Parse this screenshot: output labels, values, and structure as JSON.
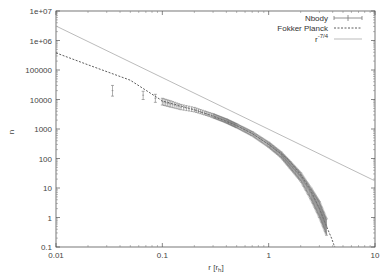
{
  "chart_data": {
    "type": "line",
    "title": "",
    "xlabel": "r [r_h]",
    "ylabel": "n",
    "xscale": "log",
    "yscale": "log",
    "xlim": [
      0.01,
      10
    ],
    "ylim": [
      0.1,
      10000000
    ],
    "grid": false,
    "legend_position": "top-right",
    "x_ticks": [
      "0.01",
      "0.1",
      "1",
      "10"
    ],
    "y_ticks": [
      "0.1",
      "1",
      "10",
      "100",
      "1000",
      "10000",
      "100000",
      "1e+06",
      "1e+07"
    ],
    "series": [
      {
        "name": "Nbody",
        "style": "points-with-errorbars",
        "color": "#777777",
        "x": [
          0.034,
          0.066,
          0.086,
          0.1,
          0.12,
          0.15,
          0.2,
          0.25,
          0.3,
          0.4,
          0.5,
          0.7,
          1.0,
          1.3,
          1.6,
          2.0,
          2.5,
          3.0,
          3.5
        ],
        "values": [
          20000,
          14000,
          11000,
          8500,
          7000,
          5500,
          4500,
          3500,
          2800,
          1900,
          1300,
          700,
          300,
          140,
          60,
          25,
          7,
          2,
          0.5
        ],
        "err_low": [
          13000,
          10000,
          8000,
          6500,
          5500,
          4500,
          3800,
          3000,
          2400,
          1600,
          1100,
          580,
          240,
          110,
          45,
          17,
          4,
          1,
          0.25
        ],
        "err_high": [
          30000,
          19000,
          15000,
          11000,
          9000,
          6800,
          5400,
          4100,
          3300,
          2200,
          1500,
          820,
          360,
          170,
          78,
          33,
          10,
          3.5,
          0.9
        ]
      },
      {
        "name": "Fokker Planck",
        "style": "dashed",
        "color": "#333333",
        "x": [
          0.01,
          0.02,
          0.05,
          0.1,
          0.2,
          0.3,
          0.5,
          0.7,
          1.0,
          1.5,
          2.0,
          2.5,
          3.0,
          3.5,
          3.9,
          4.1,
          4.2
        ],
        "values": [
          380000,
          150000,
          45000,
          9000,
          4500,
          2700,
          1300,
          700,
          300,
          100,
          28,
          8,
          2,
          0.5,
          0.2,
          0.12,
          0.1
        ]
      },
      {
        "name": "r^-7/4",
        "style": "solid",
        "color": "#aaaaaa",
        "x": [
          0.01,
          10
        ],
        "values": [
          3100000,
          17.4
        ]
      }
    ]
  },
  "legend": {
    "entries": [
      {
        "label": "Nbody"
      },
      {
        "label": "Fokker Planck"
      },
      {
        "label_base": "r",
        "label_sup": "-7/4"
      }
    ]
  },
  "axes": {
    "xlabel_base": "r [r",
    "xlabel_sub": "h",
    "xlabel_end": "]",
    "ylabel": "n"
  }
}
